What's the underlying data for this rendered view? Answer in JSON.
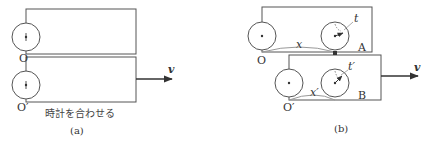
{
  "panel_a": {
    "caption": "(a)",
    "note": "時計を合わせる",
    "origin_top": "O",
    "origin_bottom": "O′",
    "velocity": "v"
  },
  "panel_b": {
    "caption": "(b)",
    "origin_top": "O",
    "origin_bottom": "O′",
    "point_top": "A",
    "point_bottom": "B",
    "time_top": "t",
    "time_bottom": "t′",
    "distance_top": "x",
    "distance_bottom": "x′",
    "velocity": "v"
  },
  "colors": {
    "stroke": "#555555",
    "text": "#333333"
  }
}
